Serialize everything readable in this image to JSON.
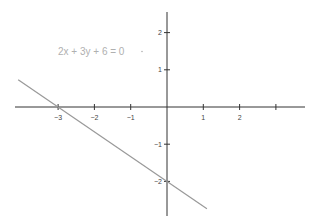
{
  "chart_data": {
    "type": "line",
    "title": "",
    "annotation": "2x + 3y + 6 = 0",
    "xlabel": "",
    "ylabel": "",
    "xlim": [
      -4.2,
      3.8
    ],
    "ylim": [
      -2.9,
      2.6
    ],
    "grid": false,
    "x_ticks": [
      -3,
      -2,
      -1,
      1,
      2,
      3
    ],
    "x_tick_labels": [
      "−3",
      "−2",
      "−1",
      "1",
      "2",
      ""
    ],
    "y_ticks": [
      2,
      1,
      -1,
      -2
    ],
    "y_tick_labels": [
      "2",
      "1",
      "−1",
      "−2"
    ],
    "series": [
      {
        "name": "2x + 3y + 6 = 0",
        "equation": "y = -(2/3)x - 2",
        "x": [
          -4.1,
          1.1
        ],
        "y": [
          0.733,
          -2.733
        ],
        "color": "#999999"
      }
    ],
    "intercepts": {
      "x_intercept": -3,
      "y_intercept": -2
    }
  },
  "colors": {
    "axis": "#333333",
    "line": "#999999",
    "label": "#b0b0b0"
  }
}
